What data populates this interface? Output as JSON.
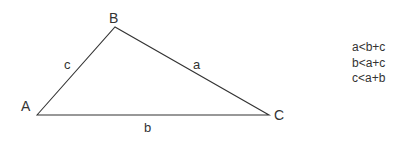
{
  "diagram": {
    "type": "triangle",
    "vertices": [
      {
        "id": "A",
        "label": "A",
        "x": 37,
        "y": 115
      },
      {
        "id": "B",
        "label": "B",
        "x": 115,
        "y": 27
      },
      {
        "id": "C",
        "label": "C",
        "x": 269,
        "y": 115
      }
    ],
    "sides": [
      {
        "id": "a",
        "label": "a",
        "from": "B",
        "to": "C"
      },
      {
        "id": "b",
        "label": "b",
        "from": "A",
        "to": "C"
      },
      {
        "id": "c",
        "label": "c",
        "from": "A",
        "to": "B"
      }
    ],
    "line_color": "#333333",
    "inequalities": [
      "a<b+c",
      "b<a+c",
      "c<a+b"
    ]
  }
}
